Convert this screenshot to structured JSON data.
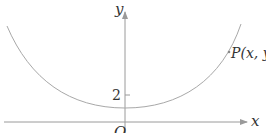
{
  "diagram": {
    "type": "coordinate-plane-curve",
    "axes": {
      "x_label": "x",
      "y_label": "y",
      "origin_label": "O",
      "y_tick_label": "2"
    },
    "curve": {
      "shape": "upward U-shaped curve (catenary/parabola-like)",
      "min_point_desc": "vertex on y-axis just below y=2"
    },
    "point": {
      "label": "P(x, y)",
      "name": "P",
      "coords": "(x,y)"
    },
    "colors": {
      "axis": "#9a9a9a",
      "curve": "#a8a8a8",
      "text": "#333333"
    }
  }
}
